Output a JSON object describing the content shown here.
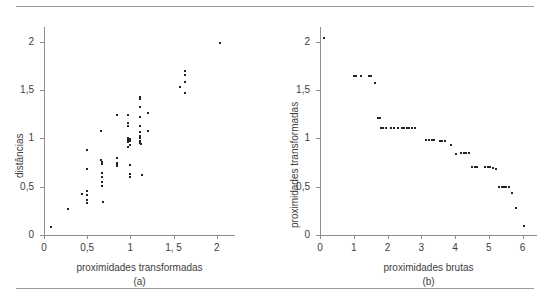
{
  "figure": {
    "top_rule": "horizontal-rule",
    "bottom_rule": "horizontal-rule"
  },
  "chart_data": [
    {
      "type": "scatter",
      "panel": "a",
      "caption": "(a)",
      "title": "",
      "xlabel": "proximidades transformadas",
      "ylabel": "distâncias",
      "xlim": [
        0,
        2.2
      ],
      "ylim": [
        0,
        2.15
      ],
      "xticks": [
        0,
        0.5,
        1,
        1.5,
        2
      ],
      "xticklabels": [
        "0",
        "0,5",
        "1",
        "1, 5",
        "2"
      ],
      "yticks": [
        0,
        0.5,
        1,
        1.5,
        2
      ],
      "yticklabels": [
        "0",
        "0,5",
        "1",
        "1,5",
        "2"
      ],
      "grid": false,
      "legend": null,
      "points": [
        [
          0.08,
          0.08
        ],
        [
          0.28,
          0.27
        ],
        [
          0.44,
          0.42
        ],
        [
          0.5,
          0.88
        ],
        [
          0.5,
          0.68
        ],
        [
          0.5,
          0.45
        ],
        [
          0.5,
          0.41
        ],
        [
          0.5,
          0.36
        ],
        [
          0.5,
          0.33
        ],
        [
          0.66,
          1.08
        ],
        [
          0.66,
          0.78
        ],
        [
          0.67,
          0.75
        ],
        [
          0.67,
          0.73
        ],
        [
          0.67,
          0.64
        ],
        [
          0.67,
          0.6
        ],
        [
          0.67,
          0.55
        ],
        [
          0.67,
          0.51
        ],
        [
          0.68,
          0.34
        ],
        [
          0.84,
          1.24
        ],
        [
          0.84,
          0.8
        ],
        [
          0.84,
          0.74
        ],
        [
          0.85,
          0.72
        ],
        [
          0.85,
          0.71
        ],
        [
          0.97,
          1.24
        ],
        [
          0.97,
          1.16
        ],
        [
          0.97,
          1.13
        ],
        [
          0.97,
          1.0
        ],
        [
          0.97,
          0.98
        ],
        [
          0.97,
          0.96
        ],
        [
          0.97,
          0.91
        ],
        [
          0.99,
          0.99
        ],
        [
          0.99,
          0.97
        ],
        [
          0.99,
          0.93
        ],
        [
          1.0,
          0.72
        ],
        [
          1.0,
          0.63
        ],
        [
          1.0,
          0.6
        ],
        [
          1.11,
          1.43
        ],
        [
          1.11,
          1.41
        ],
        [
          1.11,
          1.32
        ],
        [
          1.11,
          1.22
        ],
        [
          1.11,
          1.13
        ],
        [
          1.11,
          1.06
        ],
        [
          1.11,
          1.02
        ],
        [
          1.11,
          1.0
        ],
        [
          1.11,
          0.97
        ],
        [
          1.11,
          0.95
        ],
        [
          1.12,
          0.94
        ],
        [
          1.14,
          0.62
        ],
        [
          1.2,
          1.26
        ],
        [
          1.2,
          1.08
        ],
        [
          1.57,
          1.53
        ],
        [
          1.63,
          1.7
        ],
        [
          1.63,
          1.65
        ],
        [
          1.63,
          1.58
        ],
        [
          1.63,
          1.47
        ],
        [
          2.04,
          1.98
        ]
      ]
    },
    {
      "type": "scatter",
      "panel": "b",
      "caption": "(b)",
      "title": "",
      "xlabel": "proximidades brutas",
      "ylabel": "proximidades transformadas",
      "xlim": [
        0,
        6.4
      ],
      "ylim": [
        0,
        2.15
      ],
      "xticks": [
        0,
        1,
        2,
        3,
        4,
        5,
        6
      ],
      "xticklabels": [
        "0",
        "1",
        "2",
        "3",
        "4",
        "5",
        "6"
      ],
      "yticks": [
        0,
        0.5,
        1,
        1.5,
        2
      ],
      "yticklabels": [
        "0",
        "0,5",
        "1",
        "1,5",
        "2"
      ],
      "grid": false,
      "legend": null,
      "points": [
        [
          0.13,
          2.04
        ],
        [
          1.0,
          1.64
        ],
        [
          1.08,
          1.64
        ],
        [
          1.2,
          1.64
        ],
        [
          1.45,
          1.64
        ],
        [
          1.52,
          1.64
        ],
        [
          1.62,
          1.57
        ],
        [
          1.72,
          1.21
        ],
        [
          1.79,
          1.21
        ],
        [
          1.8,
          1.11
        ],
        [
          1.88,
          1.11
        ],
        [
          1.96,
          1.11
        ],
        [
          2.1,
          1.11
        ],
        [
          2.18,
          1.11
        ],
        [
          2.32,
          1.11
        ],
        [
          2.43,
          1.11
        ],
        [
          2.5,
          1.11
        ],
        [
          2.57,
          1.11
        ],
        [
          2.64,
          1.11
        ],
        [
          2.72,
          1.11
        ],
        [
          2.8,
          1.11
        ],
        [
          3.14,
          0.98
        ],
        [
          3.23,
          0.98
        ],
        [
          3.31,
          0.98
        ],
        [
          3.39,
          0.98
        ],
        [
          3.55,
          0.97
        ],
        [
          3.62,
          0.97
        ],
        [
          3.7,
          0.97
        ],
        [
          3.88,
          0.93
        ],
        [
          4.04,
          0.84
        ],
        [
          4.18,
          0.85
        ],
        [
          4.26,
          0.85
        ],
        [
          4.33,
          0.85
        ],
        [
          4.4,
          0.85
        ],
        [
          4.5,
          0.7
        ],
        [
          4.58,
          0.7
        ],
        [
          4.65,
          0.7
        ],
        [
          4.9,
          0.7
        ],
        [
          4.97,
          0.7
        ],
        [
          5.05,
          0.7
        ],
        [
          5.14,
          0.69
        ],
        [
          5.2,
          0.68
        ],
        [
          5.3,
          0.5
        ],
        [
          5.38,
          0.5
        ],
        [
          5.45,
          0.5
        ],
        [
          5.52,
          0.5
        ],
        [
          5.6,
          0.5
        ],
        [
          5.68,
          0.43
        ],
        [
          5.8,
          0.28
        ],
        [
          6.05,
          0.09
        ]
      ]
    }
  ]
}
